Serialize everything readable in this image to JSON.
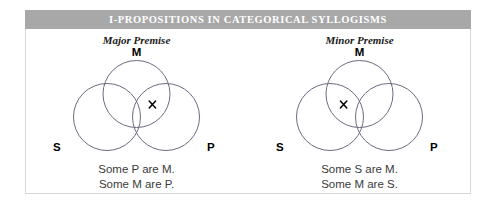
{
  "figure": {
    "title": "I-PROPOSITIONS IN CATEGORICAL SYLLOGISMS",
    "title_bar_color": "#a8a8a8",
    "title_text_color": "#ffffff",
    "frame_color": "#d8d8d8",
    "background_color": "#ffffff",
    "circle_stroke_color": "#6b6b80",
    "mark_color": "#000000"
  },
  "panels": [
    {
      "heading": "Major Premise",
      "circles": [
        {
          "label": "M",
          "position": "top"
        },
        {
          "label": "S",
          "position": "bottom-left"
        },
        {
          "label": "P",
          "position": "bottom-right"
        }
      ],
      "mark": {
        "glyph": "x",
        "region": "M-and-P",
        "meaning": "existential x on the boundary within the overlap of M and P"
      },
      "captions": [
        "Some P are M.",
        "Some M are P."
      ]
    },
    {
      "heading": "Minor Premise",
      "circles": [
        {
          "label": "M",
          "position": "top"
        },
        {
          "label": "S",
          "position": "bottom-left"
        },
        {
          "label": "P",
          "position": "bottom-right"
        }
      ],
      "mark": {
        "glyph": "x",
        "region": "S-and-M",
        "meaning": "existential x on the boundary within the overlap of S and M"
      },
      "captions": [
        "Some S are M.",
        "Some M are S."
      ]
    }
  ]
}
